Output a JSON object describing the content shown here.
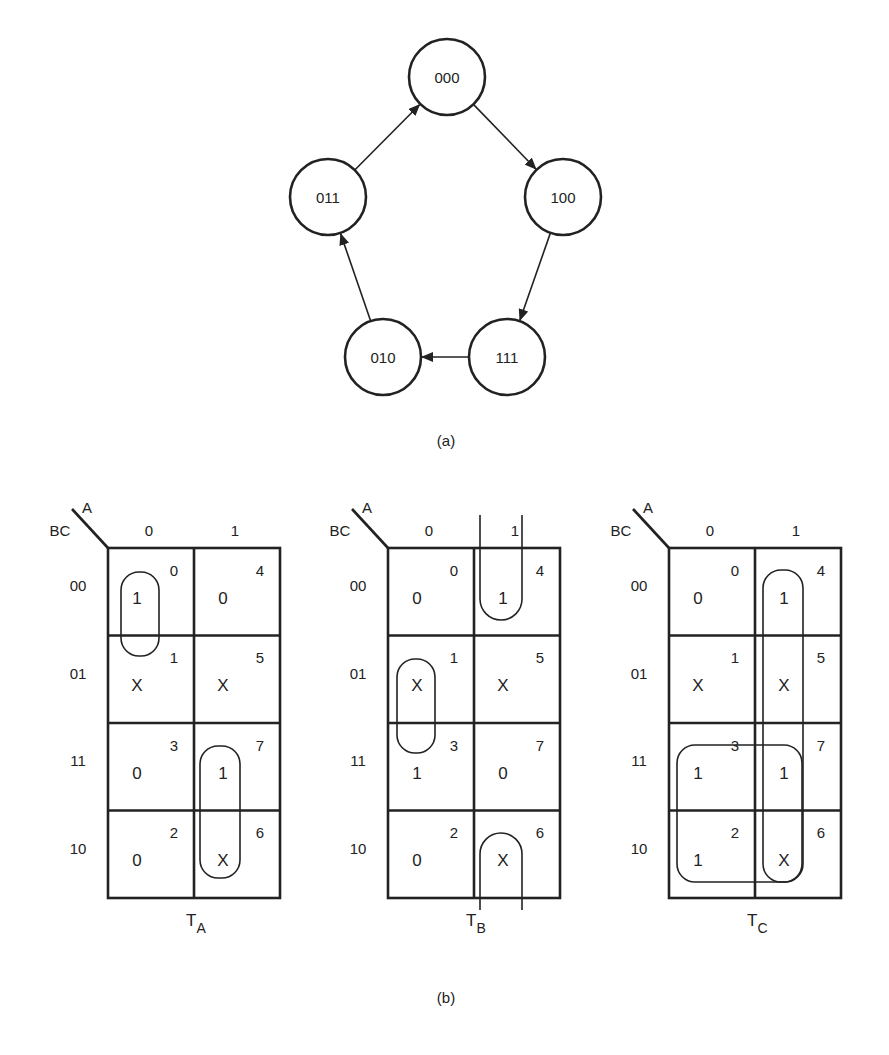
{
  "figure": {
    "caption_a": "(a)",
    "caption_b": "(b)"
  },
  "state_diagram": {
    "states": [
      {
        "id": "000",
        "label": "000",
        "x": 447,
        "y": 77
      },
      {
        "id": "100",
        "label": "100",
        "x": 563,
        "y": 197
      },
      {
        "id": "111",
        "label": "111",
        "x": 507,
        "y": 357
      },
      {
        "id": "010",
        "label": "010",
        "x": 383,
        "y": 357
      },
      {
        "id": "011",
        "label": "011",
        "x": 328,
        "y": 197
      }
    ],
    "radius": 38,
    "transitions": [
      {
        "from": "000",
        "to": "100"
      },
      {
        "from": "100",
        "to": "111"
      },
      {
        "from": "111",
        "to": "010"
      },
      {
        "from": "010",
        "to": "011"
      },
      {
        "from": "011",
        "to": "000"
      }
    ]
  },
  "kmaps": [
    {
      "name": "T_A",
      "title_main": "T",
      "title_sub": "A",
      "col_var": "A",
      "row_var": "BC",
      "col_labels": [
        "0",
        "1"
      ],
      "row_labels": [
        "00",
        "01",
        "11",
        "10"
      ],
      "origin_x": 108,
      "cells": [
        [
          "1",
          "0"
        ],
        [
          "X",
          "X"
        ],
        [
          "0",
          "1"
        ],
        [
          "0",
          "X"
        ]
      ],
      "indices": [
        [
          "0",
          "4"
        ],
        [
          "1",
          "5"
        ],
        [
          "3",
          "7"
        ],
        [
          "2",
          "6"
        ]
      ],
      "groups": [
        {
          "type": "loop",
          "x": 121,
          "y": 572,
          "w": 38,
          "h": 84
        },
        {
          "type": "loop",
          "x": 200,
          "y": 746,
          "w": 40,
          "h": 132
        }
      ]
    },
    {
      "name": "T_B",
      "title_main": "T",
      "title_sub": "B",
      "col_var": "A",
      "row_var": "BC",
      "col_labels": [
        "0",
        "1"
      ],
      "row_labels": [
        "00",
        "01",
        "11",
        "10"
      ],
      "origin_x": 388,
      "cells": [
        [
          "0",
          "1"
        ],
        [
          "X",
          "X"
        ],
        [
          "1",
          "0"
        ],
        [
          "0",
          "X"
        ]
      ],
      "indices": [
        [
          "0",
          "4"
        ],
        [
          "1",
          "5"
        ],
        [
          "3",
          "7"
        ],
        [
          "2",
          "6"
        ]
      ],
      "groups": [
        {
          "type": "u-down",
          "x": 480,
          "y_top": 515,
          "w": 42,
          "y_bottom": 620
        },
        {
          "type": "loop",
          "x": 397,
          "y": 659,
          "w": 38,
          "h": 94
        },
        {
          "type": "u-up",
          "x": 480,
          "y_top": 833,
          "w": 42,
          "y_bottom": 910
        }
      ]
    },
    {
      "name": "T_C",
      "title_main": "T",
      "title_sub": "C",
      "col_var": "A",
      "row_var": "BC",
      "col_labels": [
        "0",
        "1"
      ],
      "row_labels": [
        "00",
        "01",
        "11",
        "10"
      ],
      "origin_x": 669,
      "cells": [
        [
          "0",
          "1"
        ],
        [
          "X",
          "X"
        ],
        [
          "1",
          "1"
        ],
        [
          "1",
          "X"
        ]
      ],
      "indices": [
        [
          "0",
          "4"
        ],
        [
          "1",
          "5"
        ],
        [
          "3",
          "7"
        ],
        [
          "2",
          "6"
        ]
      ],
      "groups": [
        {
          "type": "loop",
          "x": 763,
          "y": 570,
          "w": 40,
          "h": 312
        },
        {
          "type": "loop",
          "x": 677,
          "y": 745,
          "w": 125,
          "h": 137
        }
      ]
    }
  ],
  "kmap_layout": {
    "top": 548,
    "col_width": 86,
    "row_height": 87.5
  },
  "colors": {
    "ink": "#222222",
    "background": "#ffffff"
  }
}
